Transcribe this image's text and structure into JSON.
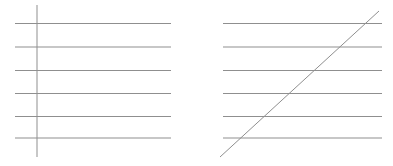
{
  "figure": {
    "background_color": "#ffffff",
    "line_color": "#8f8f8f",
    "line_width": 1,
    "canvas": {
      "width": 393,
      "height": 166
    },
    "left_panel": {
      "horizontal_lines": {
        "x1": 15,
        "x2": 171,
        "y_values": [
          23.5,
          47,
          70.5,
          93.5,
          116.5,
          138
        ]
      },
      "transversal": {
        "type": "vertical",
        "x1": 37,
        "y1": 5,
        "x2": 37,
        "y2": 157
      }
    },
    "right_panel": {
      "horizontal_lines": {
        "x1": 223,
        "x2": 382,
        "y_values": [
          23.5,
          47,
          70.5,
          93.5,
          116.5,
          138
        ]
      },
      "transversal": {
        "type": "diagonal",
        "x1": 220,
        "y1": 157,
        "x2": 379,
        "y2": 11
      }
    }
  }
}
